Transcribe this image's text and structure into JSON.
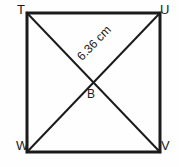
{
  "figure": {
    "kind": "geometry-diagram",
    "shape": "square-with-diagonals",
    "stroke_color": "#1b1b1b",
    "background_color": "#fefefe",
    "square": {
      "left": 27,
      "top": 13,
      "right": 160,
      "bottom": 152,
      "border_width": 3
    },
    "diagonal_width": 2,
    "vertices": [
      {
        "id": "T",
        "label": "T",
        "position": "top-left"
      },
      {
        "id": "U",
        "label": "U",
        "position": "top-right"
      },
      {
        "id": "V",
        "label": "V",
        "position": "bottom-right"
      },
      {
        "id": "W",
        "label": "W",
        "position": "bottom-left"
      }
    ],
    "intersection_point": {
      "id": "B",
      "label": "B",
      "x": 93,
      "y": 85
    },
    "diagonals": [
      {
        "id": "TV",
        "from": "T",
        "to": "V"
      },
      {
        "id": "WU",
        "from": "W",
        "to": "U"
      }
    ],
    "measurement": {
      "value": "6.36",
      "unit": "cm",
      "text": "6.36 cm",
      "along": "WU",
      "rotation_deg": -46
    }
  }
}
